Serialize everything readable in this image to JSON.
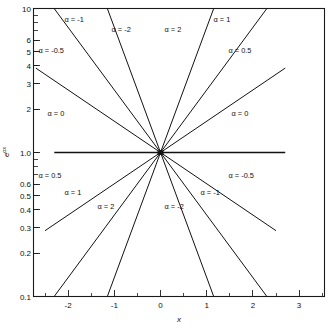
{
  "chart_data": {
    "type": "line",
    "title": "",
    "xlabel": "x",
    "ylabel": "e^(αx)",
    "yscale": "log",
    "xscale": "linear",
    "xlim": [
      -2.75,
      3.55
    ],
    "ylim": [
      0.1,
      10
    ],
    "grid": false,
    "legend": "inline-annotations",
    "xticks": [
      -2,
      -1,
      0,
      1,
      2,
      3
    ],
    "xticklabels": [
      "-2",
      "-1",
      "0",
      "1",
      "2",
      "3"
    ],
    "yticks": [
      0.1,
      0.2,
      0.3,
      0.4,
      0.5,
      0.6,
      1.0,
      2,
      3,
      4,
      5,
      6,
      10
    ],
    "yticklabels": [
      "0.1",
      "0.2",
      "0.3",
      "0.4",
      "0.5",
      "0.6",
      "1.0",
      "2",
      "3",
      "4",
      "5",
      "6",
      "10"
    ],
    "convergence_point": [
      0,
      1.0
    ],
    "series": [
      {
        "name": "α = 2",
        "alpha": 2,
        "label": "α = 2",
        "x": [
          -1.15,
          1.15
        ]
      },
      {
        "name": "α = 1",
        "alpha": 1,
        "label": "α = 1",
        "x": [
          -2.3,
          2.3
        ]
      },
      {
        "name": "α = 0.5",
        "alpha": 0.5,
        "label": "α = 0.5",
        "x": [
          -2.5,
          2.7
        ]
      },
      {
        "name": "α = 0",
        "alpha": 0,
        "label": "α = 0",
        "x": [
          -2.3,
          2.7
        ]
      },
      {
        "name": "α = -0.5",
        "alpha": -0.5,
        "label": "α = -0.5",
        "x": [
          -2.7,
          2.5
        ]
      },
      {
        "name": "α = -1",
        "alpha": -1,
        "label": "α = -1",
        "x": [
          -2.3,
          2.3
        ]
      },
      {
        "name": "α = -2",
        "alpha": -2,
        "label": "α = -2",
        "x": [
          -1.15,
          1.15
        ]
      }
    ],
    "annotations": [
      {
        "text": "α = -1",
        "x": 31,
        "y": 13
      },
      {
        "text": "α = -2",
        "x": 78,
        "y": 23
      },
      {
        "text": "α = 2",
        "x": 131,
        "y": 23
      },
      {
        "text": "α = 1",
        "x": 180,
        "y": 13
      },
      {
        "text": "α = -0.5",
        "x": 5,
        "y": 44
      },
      {
        "text": "α = 0.5",
        "x": 195,
        "y": 44
      },
      {
        "text": "α = 0",
        "x": 14,
        "y": 107
      },
      {
        "text": "α = 0",
        "x": 198,
        "y": 107
      },
      {
        "text": "α = 0.5",
        "x": 5,
        "y": 169
      },
      {
        "text": "α = -0.5",
        "x": 195,
        "y": 169
      },
      {
        "text": "α = 1",
        "x": 31,
        "y": 186
      },
      {
        "text": "α = -1",
        "x": 167,
        "y": 186
      },
      {
        "text": "α = 2",
        "x": 64,
        "y": 200
      },
      {
        "text": "α = -2",
        "x": 131,
        "y": 200
      }
    ]
  },
  "axes": {
    "x_title": "x",
    "y_title_base": "e",
    "y_title_exponent": "αx"
  },
  "colors": {
    "line": "#121212",
    "frame": "#1a1a1a",
    "background": "#ffffff"
  }
}
